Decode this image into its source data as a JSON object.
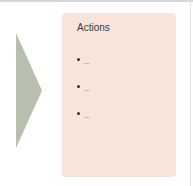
{
  "arrow": {
    "direction": "right",
    "color": "#b8bfae"
  },
  "card": {
    "title": "Actions",
    "background": "#f9e4dc",
    "items": [
      {
        "label": "..."
      },
      {
        "label": "..."
      },
      {
        "label": "..."
      }
    ]
  }
}
